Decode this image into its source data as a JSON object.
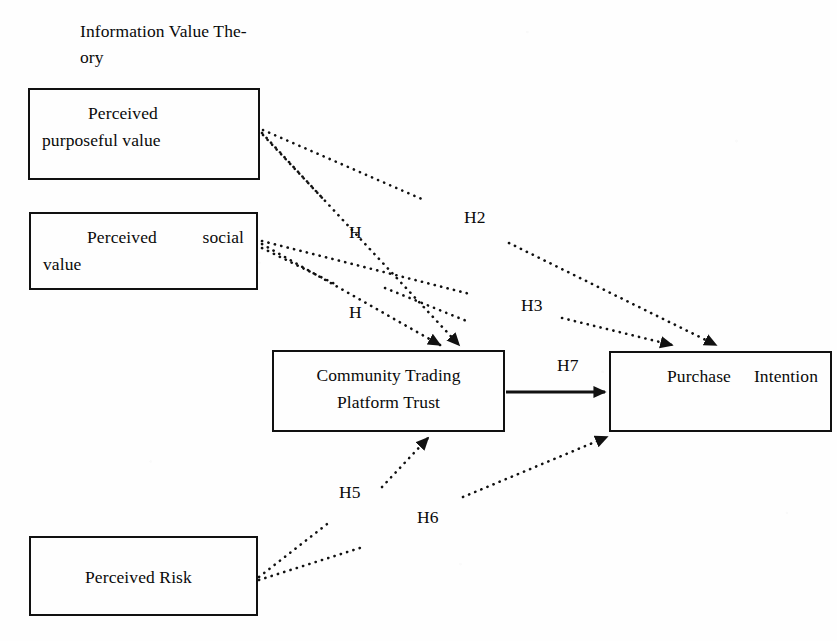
{
  "figure": {
    "type": "research-model-diagram",
    "theory_label": "Information Value The-\nory",
    "background_color": "#fefefe",
    "line_color": "#111111"
  },
  "nodes": [
    {
      "id": "perceived-purposeful-value",
      "label": "Perceived\npurposeful value",
      "x": 28,
      "y": 88,
      "w": 232,
      "h": 92
    },
    {
      "id": "perceived-social-value",
      "label": "Perceived social value",
      "x": 29,
      "y": 212,
      "w": 229,
      "h": 78
    },
    {
      "id": "community-trading-platform-trust",
      "label": "Community Trading\nPlatform Trust",
      "x": 272,
      "y": 350,
      "w": 233,
      "h": 82
    },
    {
      "id": "purchase-intention",
      "label": "Purchase Intention",
      "x": 609,
      "y": 351,
      "w": 223,
      "h": 81
    },
    {
      "id": "perceived-risk",
      "label": "Perceived Risk",
      "x": 29,
      "y": 536,
      "w": 229,
      "h": 80
    }
  ],
  "hypothesis_labels": [
    {
      "id": "h1a",
      "text": "H",
      "x": 349,
      "y": 222
    },
    {
      "id": "h2",
      "text": "H2",
      "x": 464,
      "y": 207
    },
    {
      "id": "h1b",
      "text": "H",
      "x": 349,
      "y": 302
    },
    {
      "id": "h3",
      "text": "H3",
      "x": 521,
      "y": 295
    },
    {
      "id": "h7",
      "text": "H7",
      "x": 557,
      "y": 355
    },
    {
      "id": "h5",
      "text": "H5",
      "x": 339,
      "y": 482
    },
    {
      "id": "h6",
      "text": "H6",
      "x": 417,
      "y": 507
    }
  ],
  "edges": [
    {
      "id": "purposeful-to-trust",
      "style": "dotted",
      "label": "H",
      "from": "perceived-purposeful-value",
      "to": "community-trading-platform-trust",
      "arrowhead": true
    },
    {
      "id": "purposeful-to-intention",
      "style": "dotted",
      "label": "H2",
      "from": "perceived-purposeful-value",
      "to": "purchase-intention",
      "arrowhead": true
    },
    {
      "id": "social-to-trust",
      "style": "dotted",
      "label": "H",
      "from": "perceived-social-value",
      "to": "community-trading-platform-trust",
      "arrowhead": true
    },
    {
      "id": "social-to-intention",
      "style": "dotted",
      "label": "H3",
      "from": "perceived-social-value",
      "to": "purchase-intention",
      "arrowhead": true
    },
    {
      "id": "trust-to-intention",
      "style": "solid",
      "label": "H7",
      "from": "community-trading-platform-trust",
      "to": "purchase-intention",
      "arrowhead": true
    },
    {
      "id": "risk-to-trust",
      "style": "dotted",
      "label": "H5",
      "from": "perceived-risk",
      "to": "community-trading-platform-trust",
      "arrowhead": true
    },
    {
      "id": "risk-to-intention",
      "style": "dotted",
      "label": "H6",
      "from": "perceived-risk",
      "to": "purchase-intention",
      "arrowhead": true
    }
  ]
}
